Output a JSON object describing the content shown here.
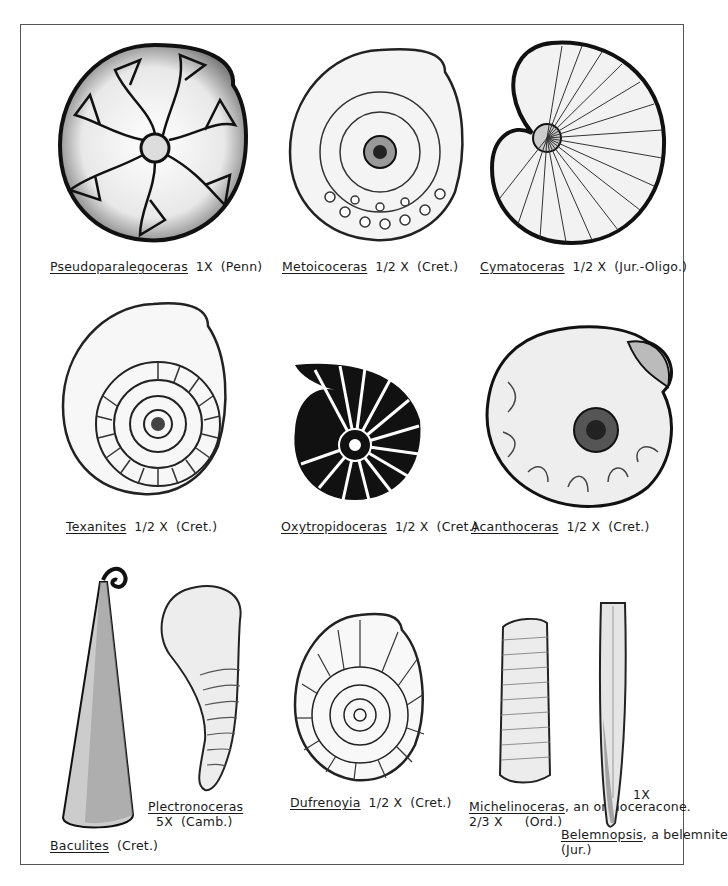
{
  "plate": {
    "specimens": [
      {
        "genus": "Pseudoparalegoceras",
        "scale": "1X",
        "period": "(Penn)",
        "note": ""
      },
      {
        "genus": "Metoicoceras",
        "scale": "1/2 X",
        "period": "(Cret.)",
        "note": ""
      },
      {
        "genus": "Cymatoceras",
        "scale": "1/2 X",
        "period": "(Jur.-Oligo.)",
        "note": ""
      },
      {
        "genus": "Texanites",
        "scale": "1/2 X",
        "period": "(Cret.)",
        "note": ""
      },
      {
        "genus": "Oxytropidoceras",
        "scale": "1/2 X",
        "period": "(Cret.)",
        "note": ""
      },
      {
        "genus": "Acanthoceras",
        "scale": "1/2 X",
        "period": "(Cret.)",
        "note": ""
      },
      {
        "genus": "Baculites",
        "scale": "",
        "period": "(Cret.)",
        "note": ""
      },
      {
        "genus": "Plectronoceras",
        "scale": "5X",
        "period": "(Camb.)",
        "note": ""
      },
      {
        "genus": "Dufrenoyia",
        "scale": "1/2 X",
        "period": "(Cret.)",
        "note": ""
      },
      {
        "genus": "Michelinoceras",
        "scale": "2/3 X",
        "period": "(Ord.)",
        "note": ", an orthoceracone."
      },
      {
        "genus": "Belemnopsis",
        "scale": "1X",
        "period": "(Jur.)",
        "note": ", a belemnite"
      }
    ]
  },
  "colors": {
    "ink": "#1a1a1a",
    "frame": "#555555",
    "paper": "#ffffff"
  }
}
